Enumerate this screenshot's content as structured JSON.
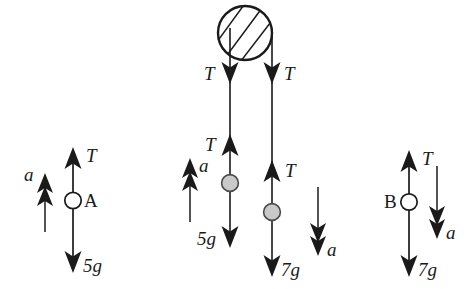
{
  "figure": {
    "type": "physics-free-body-diagram",
    "background_color": "#ffffff",
    "stroke_color": "#1a1a1a",
    "mass_fill_color": "#c9c9c9",
    "particle_fill_color": "#ffffff"
  },
  "panels": [
    {
      "id": "panel-left",
      "name": "particle-a-free-body",
      "particle": {
        "label": "A",
        "style": "hollow-circle",
        "label_side": "right"
      },
      "forces": [
        {
          "name": "tension-up",
          "label": "T",
          "direction": "up",
          "label_side": "right"
        },
        {
          "name": "weight-down",
          "label": "5g",
          "direction": "down",
          "label_side": "right"
        }
      ],
      "acceleration": {
        "name": "acceleration-up",
        "label": "a",
        "direction": "up",
        "label_side": "left",
        "head_count": 2
      }
    },
    {
      "id": "panel-middle",
      "name": "pulley-system",
      "pulley": {
        "name": "pulley",
        "style": "hatched-circle",
        "hatch_lines": 3
      },
      "strings": [
        {
          "id": "string-left",
          "name": "left-string",
          "mass": {
            "label": "",
            "style": "filled-circle"
          },
          "forces": [
            {
              "name": "tension-down-at-pulley",
              "label": "T",
              "direction": "down",
              "label_side": "left"
            },
            {
              "name": "tension-up-on-mass",
              "label": "T",
              "direction": "up",
              "label_side": "left"
            },
            {
              "name": "weight-down",
              "label": "5g",
              "direction": "down",
              "label_side": "left"
            }
          ],
          "acceleration": {
            "name": "acceleration-up",
            "label": "a",
            "direction": "up",
            "label_side": "right",
            "head_count": 2
          }
        },
        {
          "id": "string-right",
          "name": "right-string",
          "mass": {
            "label": "",
            "style": "filled-circle"
          },
          "forces": [
            {
              "name": "tension-down-at-pulley",
              "label": "T",
              "direction": "down",
              "label_side": "right"
            },
            {
              "name": "tension-up-on-mass",
              "label": "T",
              "direction": "up",
              "label_side": "right"
            },
            {
              "name": "weight-down",
              "label": "7g",
              "direction": "down",
              "label_side": "right"
            }
          ],
          "acceleration": {
            "name": "acceleration-down",
            "label": "a",
            "direction": "down",
            "label_side": "right",
            "head_count": 2
          }
        }
      ]
    },
    {
      "id": "panel-right",
      "name": "particle-b-free-body",
      "particle": {
        "label": "B",
        "style": "hollow-circle",
        "label_side": "left"
      },
      "forces": [
        {
          "name": "tension-up",
          "label": "T",
          "direction": "up",
          "label_side": "right"
        },
        {
          "name": "weight-down",
          "label": "7g",
          "direction": "down",
          "label_side": "right"
        }
      ],
      "acceleration": {
        "name": "acceleration-down",
        "label": "a",
        "direction": "down",
        "label_side": "right",
        "head_count": 2
      }
    }
  ],
  "labels": {
    "left_tension": "T",
    "left_weight": "5g",
    "left_accel": "a",
    "left_particle": "A",
    "mid_left_tension_pulley": "T",
    "mid_left_tension_mass": "T",
    "mid_left_weight": "5g",
    "mid_left_accel": "a",
    "mid_right_tension_pulley": "T",
    "mid_right_tension_mass": "T",
    "mid_right_weight": "7g",
    "mid_right_accel": "a",
    "right_tension": "T",
    "right_weight": "7g",
    "right_accel": "a",
    "right_particle": "B"
  }
}
